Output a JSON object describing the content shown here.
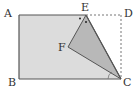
{
  "diagram": {
    "type": "geometry-fold",
    "points": {
      "A": {
        "label": "A",
        "x": 19,
        "y": 15
      },
      "B": {
        "label": "B",
        "x": 19,
        "y": 79
      },
      "C": {
        "label": "C",
        "x": 121,
        "y": 79
      },
      "D": {
        "label": "D",
        "x": 121,
        "y": 15
      },
      "E": {
        "label": "E",
        "x": 86,
        "y": 15
      },
      "F": {
        "label": "F",
        "x": 68,
        "y": 47
      }
    },
    "labels": {
      "A": "A",
      "B": "B",
      "C": "C",
      "D": "D",
      "E": "E",
      "F": "F"
    },
    "colors": {
      "rect_fill": "#dcdcdc",
      "triangle_fill": "#b8b8b8",
      "stroke": "#555555",
      "dashed": "#777777"
    }
  }
}
